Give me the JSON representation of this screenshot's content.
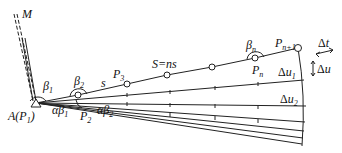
{
  "diagram": {
    "type": "traverse-error-propagation",
    "start_point": "A(P1)",
    "reference_direction": "M",
    "labels": {
      "M": "M",
      "A": "A(P",
      "A_sub": "1",
      "A_close": ")",
      "beta1": "β",
      "beta1_sub": "1",
      "beta2": "β",
      "beta2_sub": "2",
      "betan": "β",
      "betan_sub": "n",
      "s": "s",
      "S": "S=ns",
      "P2": "P",
      "P2_sub": "2",
      "P3": "P",
      "P3_sub": "3",
      "Pn": "P",
      "Pn_sub": "n",
      "Pn1": "P",
      "Pn1_sub": "n+1",
      "ab1": "αβ",
      "ab1_sub": "1",
      "ab2": "αβ",
      "ab2_sub": "2",
      "dt": "Δt",
      "du": "Δu",
      "du1": "Δu",
      "du1_sub": "1",
      "du2": "Δu",
      "du2_sub": "2"
    },
    "colors": {
      "stroke": "#222222",
      "background": "#ffffff"
    }
  }
}
